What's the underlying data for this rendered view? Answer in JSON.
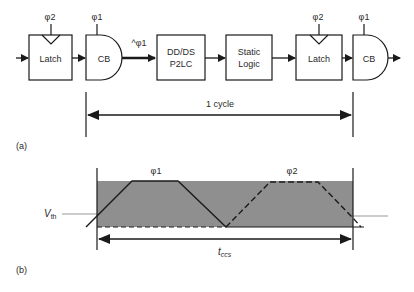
{
  "figure_a": {
    "label": "(a)",
    "blocks": [
      {
        "id": "latch1",
        "label": "Latch",
        "clock": "φ2"
      },
      {
        "id": "cb1",
        "label": "CB",
        "clock": "φ1"
      },
      {
        "id": "p2lc",
        "label_line1": "DD/DS",
        "label_line2": "P2LC"
      },
      {
        "id": "static",
        "label_line1": "Static",
        "label_line2": "Logic"
      },
      {
        "id": "latch2",
        "label": "Latch",
        "clock": "φ2"
      },
      {
        "id": "cb2",
        "label": "CB",
        "clock": "φ1"
      }
    ],
    "gated_clock_label": "^φ1",
    "cycle_label": "1 cycle"
  },
  "figure_b": {
    "label": "(b)",
    "phase1_label": "φ1",
    "phase2_label": "φ2",
    "vth_label": "V",
    "vth_subscript": "th",
    "tccs_label": "t",
    "tccs_subscript": "ccs"
  },
  "colors": {
    "line": "#1a1a1a",
    "shade": "#8f8f8f",
    "vth_line": "#9a9a9a"
  }
}
